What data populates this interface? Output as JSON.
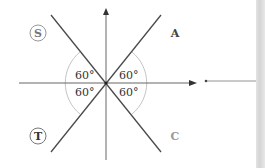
{
  "diagram": {
    "type": "astc-quadrant-diagram",
    "quadrants": {
      "top_left": {
        "label": "S",
        "circled": true
      },
      "top_right": {
        "label": "A",
        "circled": false
      },
      "bottom_left": {
        "label": "T",
        "circled": true
      },
      "bottom_right": {
        "label": "C",
        "circled": false
      }
    },
    "angles": [
      {
        "position": "upper-left",
        "label": "60°"
      },
      {
        "position": "upper-right",
        "label": "60°"
      },
      {
        "position": "lower-left",
        "label": "60°"
      },
      {
        "position": "lower-right",
        "label": "60°"
      }
    ],
    "colors": {
      "axis": "#555555",
      "diagonal": "#444444",
      "arc": "#bbbbbb",
      "label_dark": "#333333",
      "label_light": "#888888",
      "side_strip": "#d8d8d8"
    }
  }
}
